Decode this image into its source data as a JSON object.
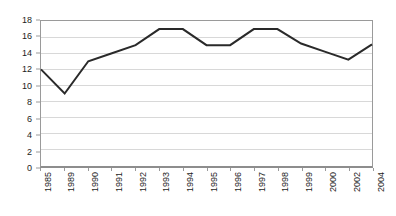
{
  "chart_data": {
    "type": "line",
    "title": "",
    "subtitle": "",
    "xlabel": "",
    "ylabel": "",
    "categories": [
      "1985",
      "1989",
      "1990",
      "1991",
      "1992",
      "1993",
      "1994",
      "1995",
      "1996",
      "1997",
      "1998",
      "1999",
      "2000",
      "2002",
      "2004"
    ],
    "series": [
      {
        "name": "",
        "values": [
          12,
          9,
          13,
          14,
          15,
          17,
          17,
          15,
          15,
          17,
          17,
          15.2,
          14.2,
          13.2,
          15.1
        ]
      }
    ],
    "ylim": [
      0,
      18
    ],
    "yticks": [
      0,
      2,
      4,
      6,
      8,
      10,
      12,
      14,
      16,
      18
    ],
    "ytick_labels": [
      "0",
      "2",
      "4",
      "6",
      "8",
      "10",
      "12",
      "14",
      "16",
      "18"
    ],
    "grid": true,
    "grid_axis": "y",
    "legend": false,
    "legend_position": "none",
    "xtick_rotation": 90
  },
  "style": {
    "line_color": "#2a2a2a",
    "grid_color": "#d8d8d8",
    "frame_color": "#9a9a9a",
    "axis_color": "#8d8d8d",
    "text_color": "#1d1d1d",
    "background": "#ffffff"
  }
}
